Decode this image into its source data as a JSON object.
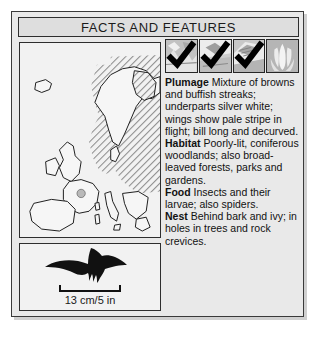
{
  "card": {
    "header_title": "FACTS AND FEATURES"
  },
  "map_panel": {
    "name": "europe-distribution-map",
    "description": "Map of Europe with hatched range shading over central, eastern and northern Europe"
  },
  "silhouette_panel": {
    "name": "bird-flight-silhouette",
    "scale_label": "13 cm/5 in"
  },
  "icons": [
    {
      "name": "habitat-icon-1",
      "checked": true,
      "art": "woodland"
    },
    {
      "name": "habitat-icon-2",
      "checked": true,
      "art": "parkland"
    },
    {
      "name": "habitat-icon-3",
      "checked": true,
      "art": "garden"
    },
    {
      "name": "habitat-icon-4",
      "checked": false,
      "art": "tulip"
    }
  ],
  "facts": [
    {
      "term": "Plumage",
      "text": " Mixture of browns and buffish streaks; underparts silver white; wings show pale stripe in flight; bill long and decurved."
    },
    {
      "term": "Habitat",
      "text": " Poorly-lit, coniferous woodlands; also broad-leaved forests, parks and gardens."
    },
    {
      "term": "Food",
      "text": " Insects and their larvae; also spiders."
    },
    {
      "term": "Nest",
      "text": " Behind bark and ivy; in holes in trees and rock crevices."
    }
  ],
  "colors": {
    "card_bg": "#e9e9e9",
    "header_bg": "#dedede",
    "panel_bg": "#f2f2f2",
    "border": "#2e2e2e",
    "ink": "#111111",
    "icon_bg": "#bdbdbd",
    "hatch": "#8d8d8d"
  }
}
